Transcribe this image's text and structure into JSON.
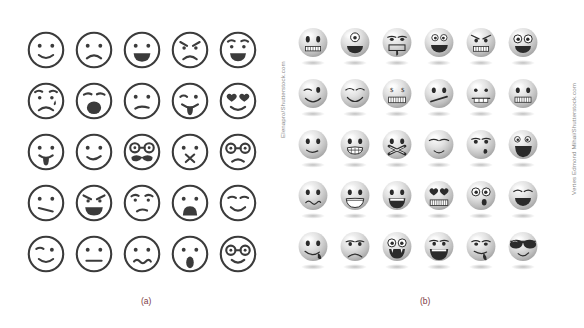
{
  "figure": {
    "background_color": "#ffffff",
    "caption_color": "#7d3a44",
    "credit_color": "#8a8a8a",
    "line_color": "#3b3b3b"
  },
  "panel_a": {
    "label": "(a)",
    "credit": "Elenapro/Shutterstock.com",
    "style": "line-art outline emoticons",
    "rows": 5,
    "columns": 5,
    "faces": [
      {
        "name": "smiling-face",
        "kind": "outline"
      },
      {
        "name": "sad-face",
        "kind": "outline"
      },
      {
        "name": "laughing-open-mouth-face",
        "kind": "outline"
      },
      {
        "name": "angry-face",
        "kind": "outline"
      },
      {
        "name": "grinning-raised-eyebrow-face",
        "kind": "outline"
      },
      {
        "name": "worried-crying-face",
        "kind": "outline"
      },
      {
        "name": "yawning-face",
        "kind": "outline"
      },
      {
        "name": "confused-face",
        "kind": "outline"
      },
      {
        "name": "winking-tongue-out-face",
        "kind": "outline"
      },
      {
        "name": "heart-eyes-face",
        "kind": "outline"
      },
      {
        "name": "tongue-out-face",
        "kind": "outline"
      },
      {
        "name": "smirking-face",
        "kind": "outline"
      },
      {
        "name": "mustache-glasses-face",
        "kind": "outline"
      },
      {
        "name": "sealed-lips-x-mouth-face",
        "kind": "outline"
      },
      {
        "name": "frowning-glasses-face",
        "kind": "outline"
      },
      {
        "name": "skeptical-flat-mouth-face",
        "kind": "outline"
      },
      {
        "name": "mischievous-grin-face",
        "kind": "outline"
      },
      {
        "name": "rolling-eyes-face",
        "kind": "outline"
      },
      {
        "name": "sad-open-mouth-face",
        "kind": "outline"
      },
      {
        "name": "content-closed-eyes-face",
        "kind": "outline"
      },
      {
        "name": "winking-smile-face",
        "kind": "outline"
      },
      {
        "name": "neutral-face",
        "kind": "outline"
      },
      {
        "name": "unamused-wavy-mouth-face",
        "kind": "outline"
      },
      {
        "name": "surprised-oval-mouth-face",
        "kind": "outline"
      },
      {
        "name": "smiling-glasses-face",
        "kind": "outline"
      }
    ]
  },
  "panel_b": {
    "label": "(b)",
    "credit": "Vertes Edmond Mihai/Shutterstock.com",
    "style": "glossy grayscale 3D sphere emoticons with drop shadows",
    "rows": 5,
    "columns": 6,
    "faces": [
      {
        "name": "gritted-teeth-face",
        "kind": "glossy"
      },
      {
        "name": "cyclops-one-eye-face",
        "kind": "glossy"
      },
      {
        "name": "tired-drooling-face",
        "kind": "glossy"
      },
      {
        "name": "big-smile-face",
        "kind": "glossy"
      },
      {
        "name": "angry-gritted-teeth-face",
        "kind": "glossy"
      },
      {
        "name": "happy-open-mouth-face",
        "kind": "glossy"
      },
      {
        "name": "winking-smile-face",
        "kind": "glossy"
      },
      {
        "name": "content-smiling-face",
        "kind": "glossy"
      },
      {
        "name": "money-eyes-face",
        "kind": "glossy"
      },
      {
        "name": "flat-slanted-mouth-face",
        "kind": "glossy"
      },
      {
        "name": "zipped-mouth-face",
        "kind": "glossy"
      },
      {
        "name": "toothy-grin-face",
        "kind": "glossy"
      },
      {
        "name": "slight-smile-face",
        "kind": "glossy"
      },
      {
        "name": "nervous-teeth-face",
        "kind": "glossy"
      },
      {
        "name": "bandaged-mouth-face",
        "kind": "glossy"
      },
      {
        "name": "relieved-face",
        "kind": "glossy"
      },
      {
        "name": "sad-tear-face",
        "kind": "glossy"
      },
      {
        "name": "shouting-open-mouth-face",
        "kind": "glossy"
      },
      {
        "name": "uneasy-wavy-mouth-face",
        "kind": "glossy"
      },
      {
        "name": "wide-toothy-smile-face",
        "kind": "glossy"
      },
      {
        "name": "cheerful-open-smile-face",
        "kind": "glossy"
      },
      {
        "name": "heart-eyes-grin-face",
        "kind": "glossy"
      },
      {
        "name": "surprised-small-mouth-face",
        "kind": "glossy"
      },
      {
        "name": "laughing-closed-eyes-face",
        "kind": "glossy"
      },
      {
        "name": "licking-lips-face",
        "kind": "glossy"
      },
      {
        "name": "frowning-sad-face",
        "kind": "glossy"
      },
      {
        "name": "vampire-fangs-face",
        "kind": "glossy"
      },
      {
        "name": "joyful-big-mouth-face",
        "kind": "glossy"
      },
      {
        "name": "sleepy-drooling-face",
        "kind": "glossy"
      },
      {
        "name": "sunglasses-cool-face",
        "kind": "glossy"
      }
    ]
  }
}
